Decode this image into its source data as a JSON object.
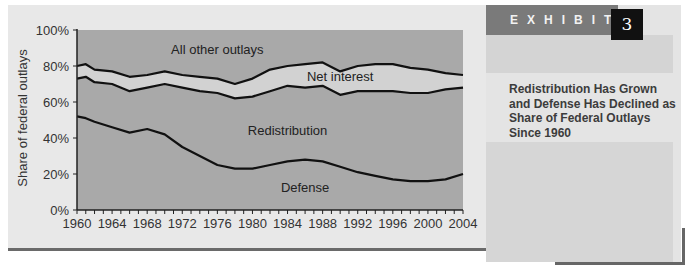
{
  "exhibit": {
    "label": "EXHIBIT",
    "number": "3",
    "title": "Redistribution Has Grown and Defense Has Declined as Share of Federal Outlays Since 1960"
  },
  "colors": {
    "plot_area": "#a9a9a9",
    "net_interest_band": "#d2d2d2",
    "lines": "#111111",
    "exhibit_bar": "#7a7a7a",
    "exhibit_number_bg": "#111111"
  },
  "chart_data": {
    "type": "area",
    "stacked": true,
    "title": "Redistribution Has Grown and Defense Has Declined as Share of Federal Outlays Since 1960",
    "xlabel": "",
    "ylabel": "Share of federal outlays",
    "ylim": [
      0,
      100
    ],
    "xlim": [
      1960,
      2004
    ],
    "grid": false,
    "x_tick_labels": [
      "1960",
      "1964",
      "1968",
      "1972",
      "1976",
      "1980",
      "1984",
      "1988",
      "1992",
      "1996",
      "2000",
      "2004"
    ],
    "y_tick_labels": [
      "0%",
      "20%",
      "40%",
      "60%",
      "80%",
      "100%"
    ],
    "x": [
      1960,
      1961,
      1962,
      1964,
      1966,
      1968,
      1970,
      1972,
      1974,
      1976,
      1978,
      1980,
      1982,
      1984,
      1986,
      1988,
      1990,
      1992,
      1994,
      1996,
      1998,
      2000,
      2002,
      2004
    ],
    "series": [
      {
        "name": "Defense",
        "values": [
          52,
          51,
          49,
          46,
          43,
          45,
          42,
          35,
          30,
          25,
          23,
          23,
          25,
          27,
          28,
          27,
          24,
          21,
          19,
          17,
          16,
          16,
          17,
          20
        ]
      },
      {
        "name": "Redistribution",
        "values": [
          21,
          23,
          22,
          24,
          23,
          23,
          28,
          33,
          36,
          40,
          39,
          40,
          41,
          42,
          40,
          42,
          40,
          45,
          47,
          49,
          49,
          49,
          50,
          48
        ]
      },
      {
        "name": "Net interest",
        "values": [
          7,
          7,
          7,
          7,
          8,
          7,
          7,
          7,
          8,
          8,
          8,
          10,
          12,
          11,
          13,
          13,
          13,
          14,
          15,
          15,
          14,
          13,
          9,
          7
        ]
      },
      {
        "name": "All other outlays",
        "values": [
          20,
          19,
          22,
          23,
          26,
          25,
          23,
          25,
          26,
          27,
          30,
          27,
          22,
          20,
          19,
          18,
          23,
          20,
          19,
          19,
          21,
          22,
          24,
          25
        ]
      }
    ],
    "annotations": [
      {
        "text": "All other outlays",
        "x": 1976,
        "y": 89
      },
      {
        "text": "Net interest",
        "x": 1990,
        "y": 74
      },
      {
        "text": "Redistribution",
        "x": 1984,
        "y": 44
      },
      {
        "text": "Defense",
        "x": 1986,
        "y": 12
      }
    ],
    "legend": "none (inline labels)"
  }
}
